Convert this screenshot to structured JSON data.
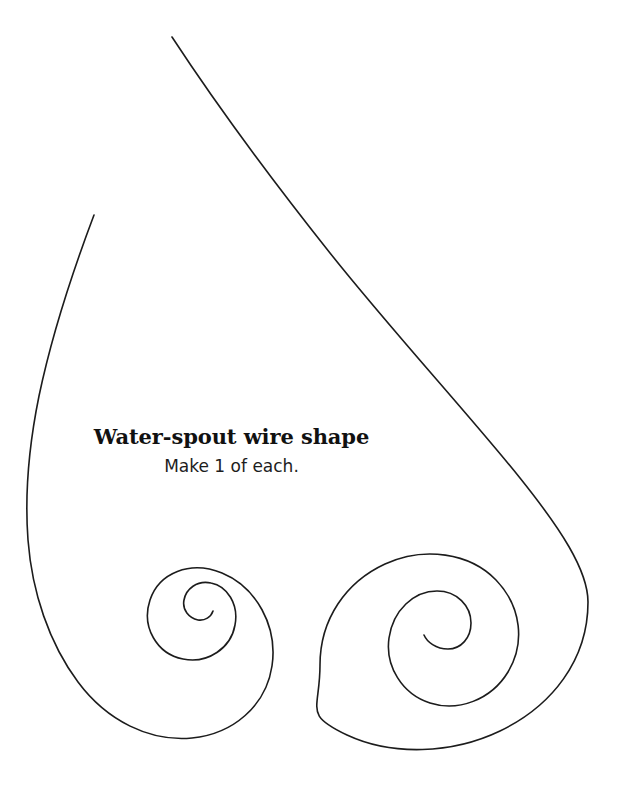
{
  "canvas": {
    "width": 633,
    "height": 793,
    "background_color": "#ffffff",
    "stroke_color": "#1c1c1c",
    "stroke_width": 1.6
  },
  "labels": {
    "title": "Water-spout wire shape",
    "subtitle": "Make 1 of each."
  },
  "diagram": {
    "name": "water-spout-wire-shape",
    "elements": [
      {
        "name": "long-sweep-curve",
        "description": "Long curve sweeping from upper area down the right side into the large right spiral",
        "start_point": [
          172,
          37
        ],
        "end_point": [
          428,
          636
        ]
      },
      {
        "name": "left-outer-curve",
        "description": "Curve from upper left sweeping down the left side into the small left spiral",
        "start_point": [
          94,
          215
        ],
        "end_point": [
          213,
          599
        ]
      },
      {
        "name": "left-spiral",
        "description": "Small spiral at lower left winding inward counterclockwise, about 1.5 turns",
        "center": [
          213,
          598
        ],
        "outer_radius": 60,
        "turns": 1.5
      },
      {
        "name": "right-spiral",
        "description": "Large spiral at lower right winding inward counterclockwise, about 2.5 turns",
        "center": [
          428,
          636
        ],
        "outer_radius": 108,
        "turns": 2.5
      }
    ],
    "extents": {
      "leftmost_x": 28,
      "rightmost_x": 588,
      "topmost_y": 37,
      "bottommost_y": 752
    }
  }
}
